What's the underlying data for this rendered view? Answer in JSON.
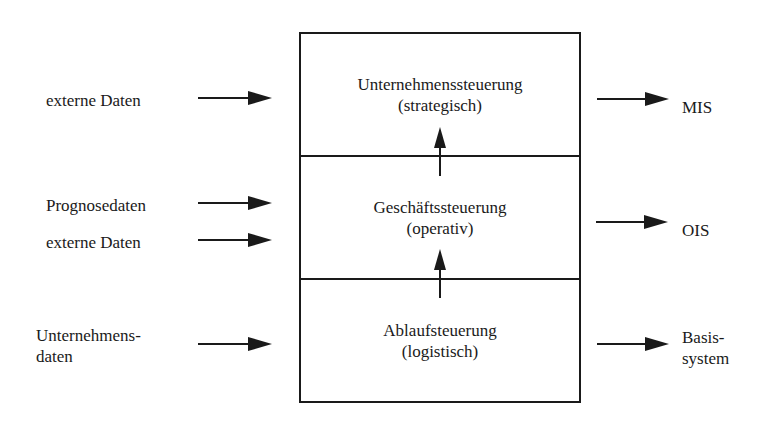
{
  "diagram": {
    "layers": [
      {
        "title": "Unternehmenssteuerung",
        "subtitle": "(strategisch)"
      },
      {
        "title": "Geschäftssteuerung",
        "subtitle": "(operativ)"
      },
      {
        "title": "Ablaufsteuerung",
        "subtitle": "(logistisch)"
      }
    ],
    "inputs": [
      {
        "lines": [
          "externe Daten"
        ]
      },
      {
        "lines": [
          "Prognosedaten"
        ]
      },
      {
        "lines": [
          "externe Daten"
        ]
      },
      {
        "lines": [
          "Unternehmens-",
          "daten"
        ]
      }
    ],
    "outputs": [
      {
        "lines": [
          "MIS"
        ]
      },
      {
        "lines": [
          "OIS"
        ]
      },
      {
        "lines": [
          "Basis-",
          "system"
        ]
      }
    ],
    "colors": {
      "ink": "#1a1a1a",
      "background": "#ffffff"
    }
  }
}
